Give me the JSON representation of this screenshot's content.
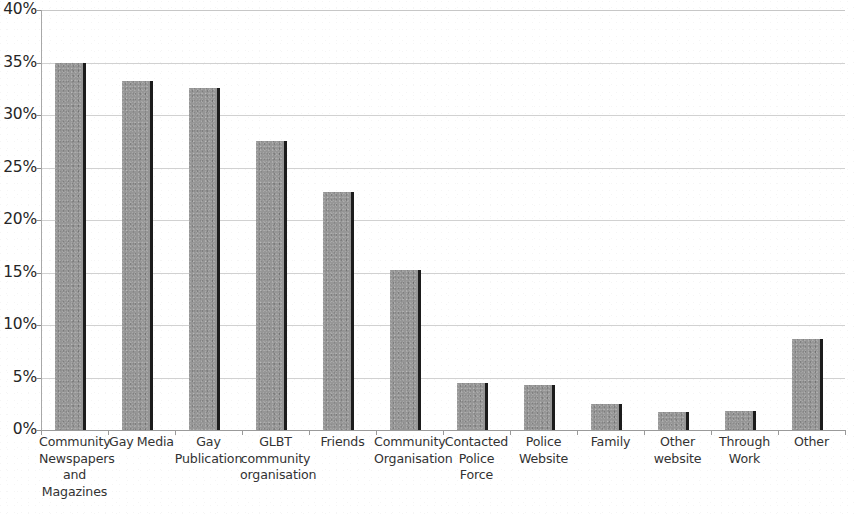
{
  "chart_data": {
    "type": "bar",
    "title": "",
    "xlabel": "",
    "ylabel": "",
    "ylim": [
      0,
      40
    ],
    "y_tick_labels": [
      "0%",
      "5%",
      "10%",
      "15%",
      "20%",
      "25%",
      "30%",
      "35%",
      "40%"
    ],
    "y_tick_values": [
      0,
      5,
      10,
      15,
      20,
      25,
      30,
      35,
      40
    ],
    "grid": true,
    "legend": "none",
    "bar_color": "#969696",
    "bar_edge_color": "#1c1c1c",
    "gridline_color": "#cfcfcf",
    "axis_color": "#9a9a9a",
    "value_suffix": "%",
    "categories": [
      "Community Newspapers and Magazines",
      "Gay Media",
      "Gay Publication",
      "GLBT community organisation",
      "Friends",
      "Community Organisation",
      "Contacted Police Force",
      "Police Website",
      "Family",
      "Other website",
      "Through Work",
      "Other"
    ],
    "category_lines": [
      [
        "Community",
        "Newspapers",
        "and",
        "Magazines"
      ],
      [
        "Gay Media"
      ],
      [
        "Gay",
        "Publication"
      ],
      [
        "GLBT",
        "community",
        "organisation"
      ],
      [
        "Friends"
      ],
      [
        "Community",
        "Organisation"
      ],
      [
        "Contacted",
        "Police Force"
      ],
      [
        "Police",
        "Website"
      ],
      [
        "Family"
      ],
      [
        "Other",
        "website"
      ],
      [
        "Through",
        "Work"
      ],
      [
        "Other"
      ]
    ],
    "values": [
      35.0,
      33.2,
      32.6,
      27.5,
      22.7,
      15.2,
      4.5,
      4.3,
      2.5,
      1.7,
      1.8,
      8.7
    ]
  }
}
